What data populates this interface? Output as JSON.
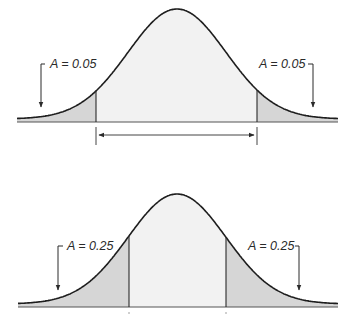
{
  "diagram": {
    "type": "normal-distribution-tail-areas",
    "panels": [
      {
        "id": "top",
        "description": "Normal curve with two shaded tails, each of area 0.05, and a double-headed arrow spanning the central region",
        "left_label": "A = 0.05",
        "right_label": "A = 0.05",
        "tail_area": 0.05,
        "has_span_arrow": true
      },
      {
        "id": "bottom",
        "description": "Normal curve with two shaded tails, each of area 0.25",
        "left_label": "A = 0.25",
        "right_label": "A = 0.25",
        "tail_area": 0.25,
        "has_span_arrow": false
      }
    ]
  },
  "colors": {
    "curve": "#1e1e1e",
    "tail_fill": "#d6d6d6",
    "center_fill": "#f2f2f2",
    "baseline": "#555555",
    "background": "#ffffff"
  }
}
